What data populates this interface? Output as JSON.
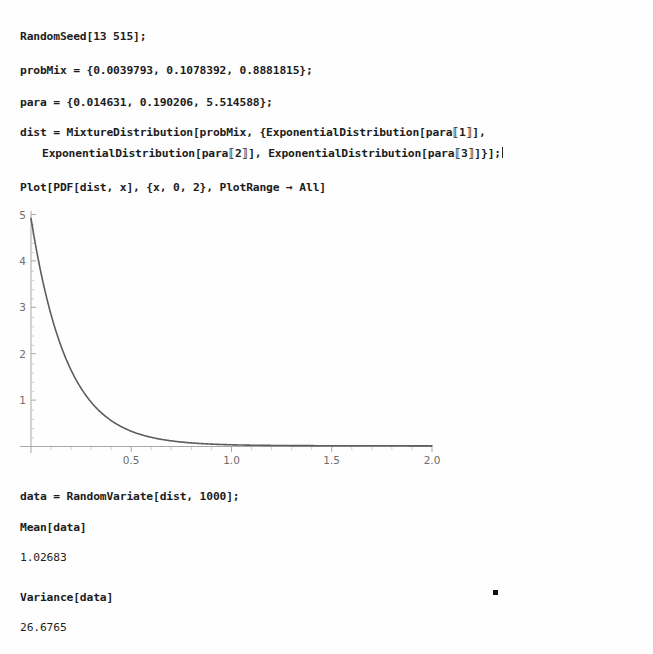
{
  "document": {
    "kind": "notebook",
    "background": "#ffffff",
    "text_color": "#1c1c1c"
  },
  "cells": {
    "input_1": "RandomSeed[13 515];",
    "input_2": "probMix = {0.0039793, 0.1078392, 0.8881815};",
    "input_3": "para = {0.014631, 0.190206, 5.514588};",
    "input_4_line1": "dist = MixtureDistribution[probMix, {ExponentialDistribution[para⟦1⟧],",
    "input_4_line2": "ExponentialDistribution[para⟦2⟧], ExponentialDistribution[para⟦3⟧]}];",
    "input_5": "Plot[PDF[dist, x], {x, 0, 2}, PlotRange → All]",
    "input_6": "data = RandomVariate[dist, 1000];",
    "input_7": "Mean[data]",
    "output_7": "1.02683",
    "input_8": "Variance[data]",
    "output_8": "26.6765"
  },
  "chart_data": {
    "type": "line",
    "title": "",
    "xlabel": "",
    "ylabel": "",
    "xlim": [
      0,
      2
    ],
    "ylim": [
      0,
      5.1
    ],
    "xticks": [
      "0.5",
      "1.0",
      "1.5",
      "2.0"
    ],
    "xtick_values": [
      0.5,
      1.0,
      1.5,
      2.0
    ],
    "yticks": [
      "1",
      "2",
      "3",
      "4",
      "5"
    ],
    "ytick_values": [
      1,
      2,
      3,
      4,
      5
    ],
    "grid": false,
    "legend": "none",
    "line_color": "#5a5a5a",
    "axis_color": "#9a9a9a",
    "mixture_weights": [
      0.0039793,
      0.1078392,
      0.8881815
    ],
    "mixture_rates": [
      0.014631,
      0.190206,
      5.514588
    ],
    "x": [
      0,
      0.02,
      0.04,
      0.06,
      0.08,
      0.1,
      0.125,
      0.15,
      0.175,
      0.2,
      0.25,
      0.3,
      0.35,
      0.4,
      0.45,
      0.5,
      0.6,
      0.7,
      0.8,
      0.9,
      1.0,
      1.2,
      1.4,
      1.6,
      1.8,
      2.0
    ],
    "y": [
      4.921,
      4.41,
      3.954,
      3.546,
      3.18,
      2.854,
      2.494,
      2.184,
      1.917,
      1.687,
      1.32,
      1.044,
      0.836,
      0.678,
      0.557,
      0.464,
      0.335,
      0.256,
      0.206,
      0.172,
      0.148,
      0.115,
      0.093,
      0.077,
      0.064,
      0.053
    ]
  },
  "artifact": {
    "name": "stray-dot",
    "color": "#111111"
  }
}
